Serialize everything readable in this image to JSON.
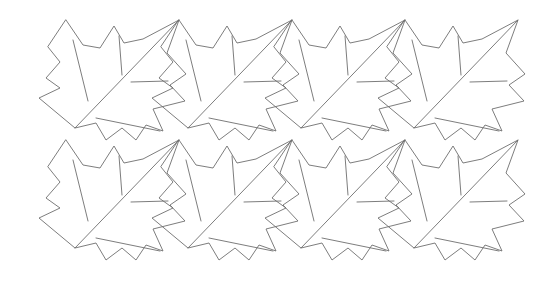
{
  "artwork": {
    "title": "Maple leaf tessellation",
    "type": "line-drawing",
    "description": "Interlocking maple-leaf shaped tiles arranged in a grid",
    "canvas": {
      "width": 550,
      "height": 289
    },
    "background_color": "#ffffff",
    "stroke_color": "#6e6e6e",
    "stroke_width": 0.9
  },
  "pattern": {
    "columns": 4,
    "rows": 2,
    "column_spacing": 113,
    "row_spacing": 120,
    "origin_x": 0,
    "origin_y": 0,
    "row_offset_x": 0,
    "bounds": {
      "left": 38,
      "top": 18,
      "right": 521,
      "bottom": 274
    },
    "tile_name": "maple-leaf-tile"
  },
  "tile": {
    "name": "maple-leaf-tile",
    "outline_points": [
      [
        66,
        20
      ],
      [
        83,
        45
      ],
      [
        100,
        48
      ],
      [
        114,
        26
      ],
      [
        124,
        43
      ],
      [
        143,
        39
      ],
      [
        179,
        20
      ],
      [
        167,
        53
      ],
      [
        186,
        74
      ],
      [
        170,
        85
      ],
      [
        185,
        101
      ],
      [
        153,
        109
      ],
      [
        163,
        131
      ],
      [
        146,
        125
      ],
      [
        136,
        140
      ],
      [
        122,
        128
      ],
      [
        106,
        140
      ],
      [
        96,
        123
      ],
      [
        75,
        128
      ],
      [
        39,
        98
      ],
      [
        60,
        88
      ],
      [
        46,
        78
      ],
      [
        60,
        62
      ],
      [
        48,
        47
      ]
    ],
    "veins": [
      {
        "name": "midrib-diagonal",
        "from": [
          75,
          128
        ],
        "to": [
          179,
          20
        ]
      },
      {
        "name": "left-vein",
        "from": [
          73,
          40
        ],
        "to": [
          88,
          101
        ]
      },
      {
        "name": "center-vein",
        "from": [
          119,
          36
        ],
        "to": [
          122,
          75
        ]
      },
      {
        "name": "right-horizontal-vein",
        "from": [
          131,
          82
        ],
        "to": [
          168,
          81
        ]
      },
      {
        "name": "lower-vein",
        "from": [
          96,
          118
        ],
        "to": [
          160,
          131
        ]
      }
    ]
  },
  "tiles": [
    {
      "id": "tile-r0-c0",
      "row": 0,
      "col": 0,
      "dx": 0,
      "dy": 0
    },
    {
      "id": "tile-r0-c1",
      "row": 0,
      "col": 1,
      "dx": 113,
      "dy": 0
    },
    {
      "id": "tile-r0-c2",
      "row": 0,
      "col": 2,
      "dx": 226,
      "dy": 0
    },
    {
      "id": "tile-r0-c3",
      "row": 0,
      "col": 3,
      "dx": 339,
      "dy": 0
    },
    {
      "id": "tile-r1-c0",
      "row": 1,
      "col": 0,
      "dx": 0,
      "dy": 120
    },
    {
      "id": "tile-r1-c1",
      "row": 1,
      "col": 1,
      "dx": 113,
      "dy": 120
    },
    {
      "id": "tile-r1-c2",
      "row": 1,
      "col": 2,
      "dx": 226,
      "dy": 120
    },
    {
      "id": "tile-r1-c3",
      "row": 1,
      "col": 3,
      "dx": 339,
      "dy": 120
    }
  ]
}
